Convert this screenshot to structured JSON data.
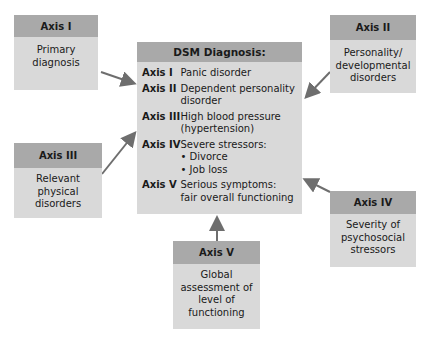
{
  "main": {
    "title": "DSM Diagnosis:",
    "rows": [
      {
        "axis": "Axis I",
        "lines": [
          "Panic disorder"
        ]
      },
      {
        "axis": "Axis II",
        "lines": [
          "Dependent personality",
          "disorder"
        ]
      },
      {
        "axis": "Axis III",
        "lines": [
          "High blood pressure",
          "(hypertension)"
        ]
      },
      {
        "axis": "Axis IV",
        "lines": [
          "Severe stressors:",
          "• Divorce",
          "• Job loss"
        ]
      },
      {
        "axis": "Axis V",
        "lines": [
          "Serious symptoms:",
          "fair overall functioning"
        ]
      }
    ]
  },
  "boxes": {
    "axis1": {
      "title": "Axis I",
      "lines": [
        "Primary",
        "diagnosis"
      ]
    },
    "axis2": {
      "title": "Axis II",
      "lines": [
        "Personality/",
        "developmental",
        "disorders"
      ]
    },
    "axis3": {
      "title": "Axis III",
      "lines": [
        "Relevant",
        "physical",
        "disorders"
      ]
    },
    "axis4": {
      "title": "Axis IV",
      "lines": [
        "Severity of",
        "psychosocial",
        "stressors"
      ]
    },
    "axis5": {
      "title": "Axis V",
      "lines": [
        "Global",
        "assessment of",
        "level of",
        "functioning"
      ]
    }
  },
  "colors": {
    "header": "#a9a9a9",
    "body": "#d9d9d9",
    "arrow": "#6e6e6e"
  }
}
